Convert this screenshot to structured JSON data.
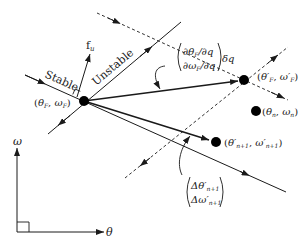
{
  "diagram": {
    "type": "OGY chaos control phase-space diagram",
    "colors": {
      "ink": "#1a1a1a",
      "background": "#ffffff"
    },
    "labels": {
      "stable": "Stable",
      "unstable": "Unstable",
      "fu": "f",
      "fu_sub": "u",
      "fixed_point": "(θ",
      "fixed_point_full": "(θF, ωF)",
      "shifted_fixed_point_full": "(θ'F, ω'F)",
      "current_point_full": "(θn, ωn)",
      "next_point_full": "(θ'n+1, ω'n+1)",
      "partial_top": "∂θF/∂q",
      "partial_bottom": "∂ωF/∂q",
      "delta_q": "δq",
      "delta_top": "Δθ'n+1",
      "delta_bottom": "Δω'n+1",
      "axis_y": "ω",
      "axis_x": "θ"
    },
    "points": [
      {
        "name": "fixed-point",
        "label": "(θF, ωF)",
        "x": 84,
        "y": 101
      },
      {
        "name": "shifted-fixed-point",
        "label": "(θ'F, ω'F)",
        "x": 244,
        "y": 80
      },
      {
        "name": "current-point",
        "label": "(θn, ωn)",
        "x": 256,
        "y": 111
      },
      {
        "name": "next-point",
        "label": "(θ'n+1, ω'n+1)",
        "x": 216,
        "y": 142
      }
    ]
  }
}
